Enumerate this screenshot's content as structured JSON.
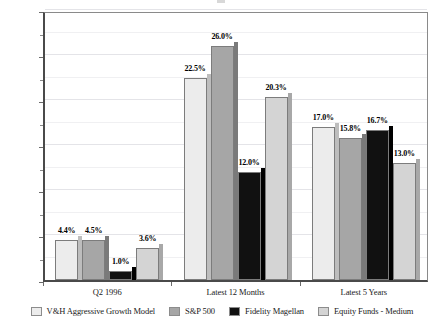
{
  "chart_data": {
    "type": "bar",
    "title": "",
    "subtitle": "",
    "xlabel": "",
    "ylabel": "",
    "categories": [
      "Q2 1996",
      "Latest 12 Months",
      "Latest 5 Years"
    ],
    "series": [
      {
        "name": "V&H Aggressive Growth Model",
        "color": "#ececec",
        "side_color": "#bdbdbd",
        "values": [
          4.4,
          22.5,
          17.0
        ],
        "labels": [
          "4.4%",
          "22.5%",
          "17.0%"
        ]
      },
      {
        "name": "S&P 500",
        "color": "#a6a6a6",
        "side_color": "#7a7a7a",
        "values": [
          4.5,
          26.0,
          15.8
        ],
        "labels": [
          "4.5%",
          "26.0%",
          "15.8%"
        ]
      },
      {
        "name": "Fidelity Magellan",
        "color": "#111111",
        "side_color": "#000000",
        "values": [
          1.0,
          12.0,
          16.7
        ],
        "labels": [
          "1.0%",
          "12.0%",
          "16.7%"
        ]
      },
      {
        "name": "Equity Funds - Medium",
        "color": "#d4d4d4",
        "side_color": "#a8a8a8",
        "values": [
          3.6,
          20.3,
          13.0
        ],
        "labels": [
          "3.6%",
          "20.3%",
          "13.0%"
        ]
      }
    ],
    "ylim": [
      0.0,
      30.0
    ],
    "ytick_labels": [
      "0.0%",
      "5.0%",
      "10.0%",
      "15.0%",
      "20.0%",
      "25.0%",
      "30.0%"
    ],
    "ytick_values": [
      0.0,
      5.0,
      10.0,
      15.0,
      20.0,
      25.0,
      30.0
    ],
    "minor_tick_values": [
      2.5,
      7.5,
      12.5,
      17.5,
      22.5,
      27.5
    ],
    "grid": true,
    "legend_position": "bottom",
    "value_labels_shown": true
  }
}
